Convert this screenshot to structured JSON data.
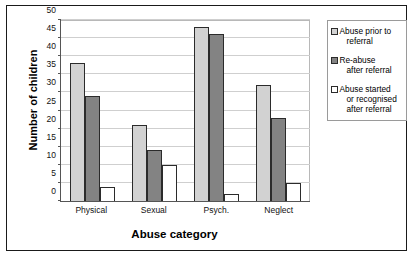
{
  "chart_data": {
    "type": "bar",
    "title": "",
    "xlabel": "Abuse category",
    "ylabel": "Number of children",
    "categories": [
      "Physical",
      "Sexual",
      "Psych.",
      "Neglect"
    ],
    "series": [
      {
        "name": "Abuse prior to referral",
        "color": "#d2d2d2",
        "values": [
          38,
          21,
          48,
          32
        ]
      },
      {
        "name": "Re-abuse after referral",
        "color": "#838383",
        "values": [
          29,
          14,
          46,
          23
        ]
      },
      {
        "name": "Abuse started or recognised after referral",
        "color": "#ffffff",
        "values": [
          4,
          10,
          2,
          5
        ]
      }
    ],
    "ylim": [
      0,
      50
    ],
    "ytick_step": 5,
    "yticks": [
      0,
      5,
      10,
      15,
      20,
      25,
      30,
      35,
      40,
      45,
      50
    ],
    "grid": true,
    "legend_position": "right",
    "legend_entries": [
      {
        "label_lines": [
          "Abuse prior to",
          "referral"
        ],
        "swatch": "s0"
      },
      {
        "label_lines": [
          "Re-abuse",
          "after referral"
        ],
        "swatch": "s1"
      },
      {
        "label_lines": [
          "Abuse started",
          "or recognised",
          "after referral"
        ],
        "swatch": "s2"
      }
    ]
  }
}
